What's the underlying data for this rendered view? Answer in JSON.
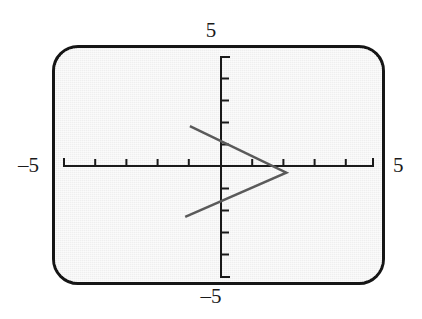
{
  "figure": {
    "name": "graphing-calculator-screen",
    "background_color": "#ffffff",
    "screen_fill": "#efefef",
    "bezel_color": "#161616",
    "axis_color": "#1a1a1a",
    "curve_color": "#5a5a5a"
  },
  "labels": {
    "top": "5",
    "bottom": "–5",
    "left": "–5",
    "right": "5"
  },
  "chart_data": {
    "type": "line",
    "title": "",
    "xlabel": "",
    "ylabel": "",
    "xlim": [
      -5,
      5
    ],
    "ylim": [
      -5,
      5
    ],
    "grid": false,
    "legend": "none",
    "x_tick_labels": [
      "–5",
      "5"
    ],
    "y_tick_labels": [
      "5",
      "–5"
    ],
    "x_ticks": [
      -4,
      -3,
      -2,
      -1,
      1,
      2,
      3,
      4
    ],
    "y_ticks": [
      -4,
      -3,
      -2,
      -1,
      1,
      2,
      3,
      4
    ],
    "tick_interval": 1,
    "axis_style": "crosshair-centered",
    "series": [
      {
        "name": "sideways-v",
        "description": "leftward-opening V shape, vertex on the right",
        "color": "#5a5a5a",
        "line_width": 2.5,
        "x": [
          -1.0,
          2.1,
          -1.15
        ],
        "y": [
          1.8,
          -0.3,
          -2.3
        ]
      }
    ],
    "annotations": [
      {
        "label": "vertex",
        "x": 2.1,
        "y": -0.3
      },
      {
        "label": "upper-branch-endpoint",
        "x": -1.0,
        "y": 1.8
      },
      {
        "label": "lower-branch-endpoint",
        "x": -1.15,
        "y": -2.3
      }
    ]
  }
}
